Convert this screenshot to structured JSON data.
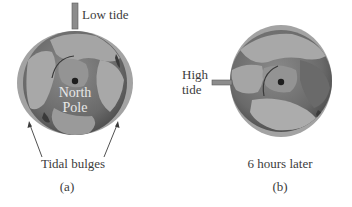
{
  "figure": {
    "panel_a": {
      "marker_label": "Low tide",
      "pole_label_line1": "North",
      "pole_label_line2": "Pole",
      "callout_label": "Tidal bulges",
      "panel_label": "(a)"
    },
    "panel_b": {
      "marker_label_line1": "High",
      "marker_label_line2": "tide",
      "caption": "6 hours later",
      "panel_label": "(b)"
    }
  },
  "colors": {
    "bulge": "#9a9a9a",
    "ocean": "#6f6f6f",
    "land": "#aaaaaa",
    "arctic": "#8a8a8a",
    "pole_dot": "#1e1e1e",
    "marker": "#8c8c8c",
    "text": "#3c3c3c"
  }
}
